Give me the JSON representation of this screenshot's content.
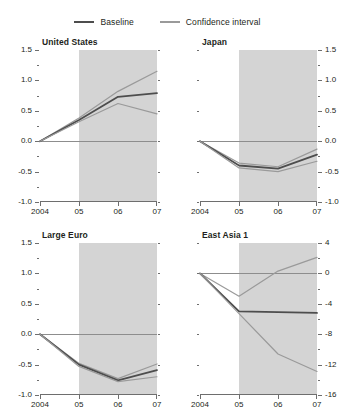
{
  "legend": {
    "entries": [
      {
        "label": "Baseline",
        "color": "#4d4d4d"
      },
      {
        "label": "Confidence interval",
        "color": "#9a9a9a"
      }
    ]
  },
  "colors": {
    "baseline": "#4d4d4d",
    "confidence": "#9a9a9a",
    "shade": "#d4d4d4",
    "axis": "#6e6e6e",
    "zeroline": "#8d8d8d",
    "text": "#231f20"
  },
  "shared": {
    "x_tick_labels": [
      "2004",
      "05",
      "06",
      "07"
    ],
    "x_values": [
      2004,
      2005,
      2006,
      2007
    ],
    "shade_start": 2005,
    "shade_end": 2007
  },
  "chart_data": [
    {
      "type": "line",
      "title": "United States",
      "position": "top-left",
      "xlabel": "",
      "ylabel": "",
      "x": [
        2004,
        2005,
        2006,
        2007
      ],
      "xlim": [
        2004,
        2007
      ],
      "ylim": [
        -1.0,
        1.5
      ],
      "ytick_labels": [
        "1.5",
        "1.0",
        "0.5",
        "0.0",
        "-0.5",
        "-1.0"
      ],
      "ytick_values": [
        1.5,
        1.0,
        0.5,
        0.0,
        -0.5,
        -1.0
      ],
      "ytick_side": "left",
      "grid": false,
      "series": [
        {
          "name": "Confidence interval",
          "kind": "upper",
          "values": [
            0.0,
            0.38,
            0.82,
            1.15
          ]
        },
        {
          "name": "Baseline",
          "kind": "baseline",
          "values": [
            0.0,
            0.35,
            0.73,
            0.79
          ]
        },
        {
          "name": "Confidence interval",
          "kind": "lower",
          "values": [
            0.0,
            0.32,
            0.62,
            0.45
          ]
        }
      ]
    },
    {
      "type": "line",
      "title": "Japan",
      "position": "top-right",
      "xlabel": "",
      "ylabel": "",
      "x": [
        2004,
        2005,
        2006,
        2007
      ],
      "xlim": [
        2004,
        2007
      ],
      "ylim": [
        -1.0,
        1.5
      ],
      "ytick_labels": [
        "1.5",
        "1.0",
        "0.5",
        "0.0",
        "-0.5",
        "-1.0"
      ],
      "ytick_values": [
        1.5,
        1.0,
        0.5,
        0.0,
        -0.5,
        -1.0
      ],
      "ytick_side": "right",
      "grid": false,
      "series": [
        {
          "name": "Confidence interval",
          "kind": "upper",
          "values": [
            0.0,
            -0.36,
            -0.42,
            -0.13
          ]
        },
        {
          "name": "Baseline",
          "kind": "baseline",
          "values": [
            0.0,
            -0.4,
            -0.45,
            -0.22
          ]
        },
        {
          "name": "Confidence interval",
          "kind": "lower",
          "values": [
            0.0,
            -0.44,
            -0.5,
            -0.33
          ]
        }
      ]
    },
    {
      "type": "line",
      "title": "Large Euro",
      "position": "bottom-left",
      "xlabel": "",
      "ylabel": "",
      "x": [
        2004,
        2005,
        2006,
        2007
      ],
      "xlim": [
        2004,
        2007
      ],
      "ylim": [
        -1.0,
        1.5
      ],
      "ytick_labels": [
        "1.5",
        "1.0",
        "0.5",
        "0.0",
        "-0.5",
        "-1.0"
      ],
      "ytick_values": [
        1.5,
        1.0,
        0.5,
        0.0,
        -0.5,
        -1.0
      ],
      "ytick_side": "left",
      "grid": false,
      "series": [
        {
          "name": "Confidence interval",
          "kind": "upper",
          "values": [
            0.0,
            -0.48,
            -0.73,
            -0.49
          ]
        },
        {
          "name": "Baseline",
          "kind": "baseline",
          "values": [
            0.0,
            -0.5,
            -0.76,
            -0.59
          ]
        },
        {
          "name": "Confidence interval",
          "kind": "lower",
          "values": [
            0.0,
            -0.53,
            -0.78,
            -0.7
          ]
        }
      ]
    },
    {
      "type": "line",
      "title": "East Asia 1",
      "position": "bottom-right",
      "xlabel": "",
      "ylabel": "",
      "x": [
        2004,
        2005,
        2006,
        2007
      ],
      "xlim": [
        2004,
        2007
      ],
      "ylim": [
        -16,
        4
      ],
      "ytick_labels": [
        "4",
        "0",
        "-4",
        "-8",
        "-12",
        "-16"
      ],
      "ytick_values": [
        4,
        0,
        -4,
        -8,
        -12,
        -16
      ],
      "ytick_side": "right",
      "grid": false,
      "series": [
        {
          "name": "Confidence interval",
          "kind": "upper",
          "values": [
            0.0,
            -3.0,
            0.3,
            2.1
          ]
        },
        {
          "name": "Baseline",
          "kind": "baseline",
          "values": [
            0.0,
            -5.0,
            -5.1,
            -5.2
          ]
        },
        {
          "name": "Confidence interval",
          "kind": "lower",
          "values": [
            0.0,
            -5.3,
            -10.6,
            -12.9
          ]
        }
      ]
    }
  ]
}
